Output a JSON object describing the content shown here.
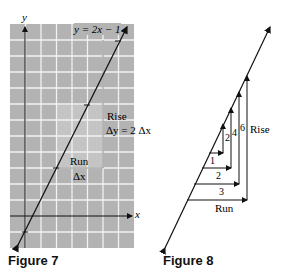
{
  "figure7": {
    "caption": "Figure 7",
    "y_axis_label": "y",
    "x_axis_label": "x",
    "equation": "y = 2x − 1",
    "rise_label": "Rise",
    "rise_formula": "Δy = 2 Δx",
    "run_label": "Run",
    "run_formula": "Δx",
    "grid_color": "#b3b3b3",
    "highlight_color": "#c8c8c8"
  },
  "figure8": {
    "caption": "Figure 8",
    "run_values": [
      "1",
      "2",
      "3"
    ],
    "rise_values": [
      "2",
      "4",
      "6"
    ],
    "rise_label": "Rise",
    "run_label": "Run"
  }
}
